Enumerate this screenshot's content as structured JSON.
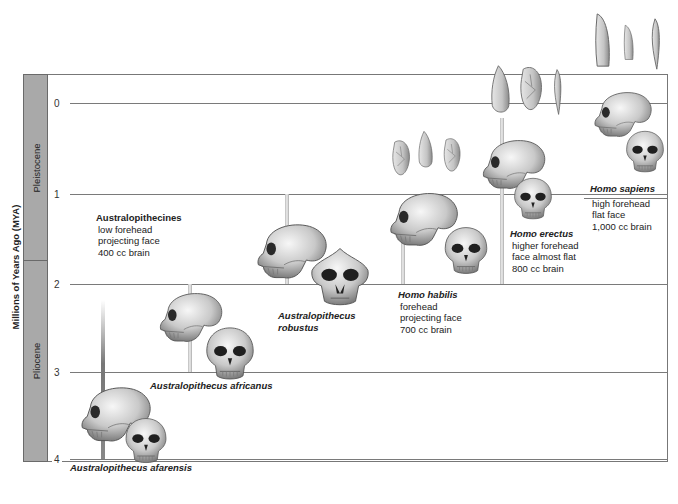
{
  "diagram": {
    "y_axis": {
      "title": "Millions of Years Ago (MYA)",
      "ticks": [
        "0",
        "1",
        "2",
        "3",
        "4"
      ]
    },
    "epochs": [
      {
        "name": "Pleistocene",
        "range_mya": [
          0,
          1.8
        ]
      },
      {
        "name": "Pliocene",
        "range_mya": [
          1.8,
          4.2
        ]
      }
    ],
    "groups": [
      {
        "name": "Australopithecines",
        "traits": [
          "low forehead",
          "projecting face",
          "400 cc brain"
        ]
      }
    ],
    "species": [
      {
        "name": "Australopithecus afarensis",
        "range_mya": [
          2.9,
          4.0
        ]
      },
      {
        "name": "Australopithecus africanus",
        "range_mya": [
          2.0,
          3.0
        ]
      },
      {
        "name": "Australopithecus",
        "name_line2": "robustus",
        "range_mya": [
          1.0,
          2.2
        ]
      },
      {
        "name": "Homo habilis",
        "range_mya": [
          1.4,
          2.1
        ],
        "traits": [
          "forehead",
          "projecting face",
          "700 cc brain"
        ]
      },
      {
        "name": "Homo erectus",
        "range_mya": [
          0.2,
          2.0
        ],
        "traits": [
          "higher forehead",
          "face almost flat",
          "800 cc brain"
        ]
      },
      {
        "name": "Homo sapiens",
        "range_mya": [
          0,
          0.5
        ],
        "traits": [
          "high forehead",
          "flat face",
          "1,000 cc brain"
        ]
      }
    ],
    "tool_sets": [
      {
        "associated_with": "Homo habilis",
        "count": 3
      },
      {
        "associated_with": "Homo erectus",
        "count": 3
      },
      {
        "associated_with": "Homo sapiens",
        "count": 3
      }
    ],
    "colors": {
      "epoch_fill": "#a9a9a9",
      "gridline": "#7a7a7a",
      "bone": "#d8d8d8",
      "bone_shadow": "#6a6a6a"
    }
  }
}
